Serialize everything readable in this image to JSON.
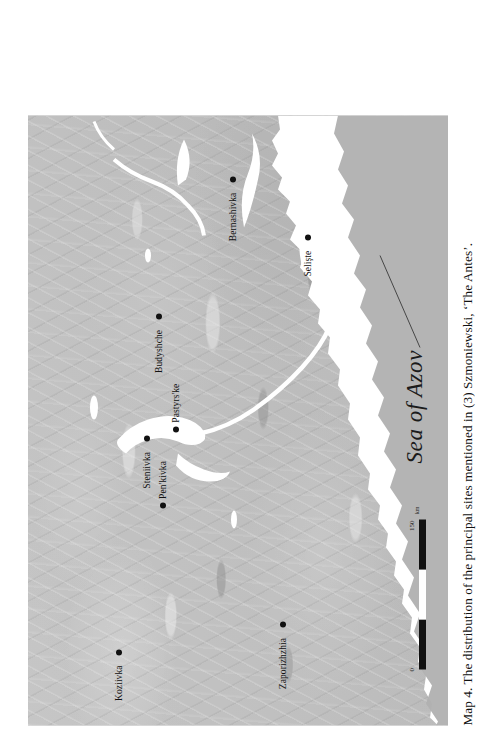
{
  "figure": {
    "caption": "Map 4. The distribution of the principal sites mentioned in (3) Szmoniewski, ‘The Antes’."
  },
  "map": {
    "sea_label": "Sea of Azov",
    "sites": [
      {
        "name": "Koziivka",
        "x": 0.115,
        "y": 0.21,
        "label_side": "left"
      },
      {
        "name": "Pen'kivka",
        "x": 0.355,
        "y": 0.315,
        "label_side": "right"
      },
      {
        "name": "Steniivka",
        "x": 0.465,
        "y": 0.275,
        "label_side": "left"
      },
      {
        "name": "Pastyrs'ke",
        "x": 0.48,
        "y": 0.345,
        "label_side": "right"
      },
      {
        "name": "Zaporizhzhia",
        "x": 0.16,
        "y": 0.6,
        "label_side": "left"
      },
      {
        "name": "Budyshche",
        "x": 0.665,
        "y": 0.305,
        "label_side": "left"
      },
      {
        "name": "Bernashivka",
        "x": 0.89,
        "y": 0.48,
        "label_side": "left"
      },
      {
        "name": "Selişte",
        "x": 0.795,
        "y": 0.66,
        "label_side": "left"
      }
    ]
  },
  "scale_bar": {
    "min_label": "0",
    "max_label": "150",
    "unit": "km",
    "segments": [
      "dark",
      "light",
      "dark"
    ]
  },
  "colors": {
    "land": "#bfbfbf",
    "water": "#ffffff",
    "ink": "#111111",
    "paper": "#ffffff"
  }
}
